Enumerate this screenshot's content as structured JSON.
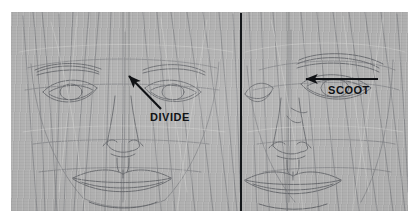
{
  "artwork": {
    "medium": "graphite-pencil-sketch-on-grey-toned-paper",
    "subject": "frontal-portrait-face-construction-study",
    "paper_color": "#adadad",
    "pencil_color": "#6d6f72",
    "highlight_color": "#d8d8d6",
    "ink_color": "#101215"
  },
  "panels": [
    {
      "name": "left-panel",
      "position": "left",
      "content": "full-frontal-face-construction-drawing-with-eyes-nose-mouth-guidelines"
    },
    {
      "name": "right-panel",
      "position": "right",
      "content": "cropped-frontal-face-construction-drawing-eye-nose-mouth"
    }
  ],
  "divider": {
    "name": "vertical-black-divider-line",
    "orientation": "vertical",
    "color": "#15181b"
  },
  "annotations": [
    {
      "id": "divide",
      "text": "DIVIDE",
      "arrow": "diagonal-up-left",
      "target": "inner-eye-corner-tear-duct",
      "color": "#101215"
    },
    {
      "id": "scoot",
      "text": "SCOOT",
      "arrow": "horizontal-left",
      "target": "eye-shifts-toward-center-line",
      "color": "#101215"
    }
  ]
}
